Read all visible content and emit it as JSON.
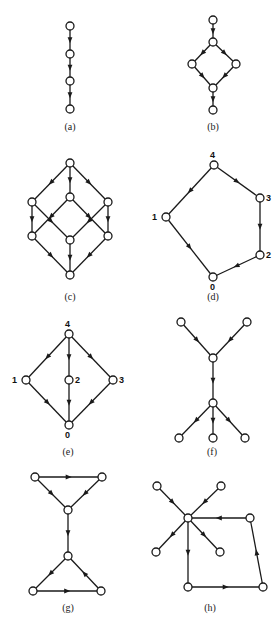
{
  "figure": {
    "width": 280,
    "height": 623,
    "colors": {
      "stroke": "#1a1a1a",
      "node_fill": "#ffffff",
      "background": "#ffffff"
    },
    "node_radius": 4,
    "panels": [
      {
        "id": "a",
        "caption": "(a)",
        "caption_pos": [
          70,
          130
        ],
        "nodes": [
          {
            "id": "a1",
            "x": 70,
            "y": 26
          },
          {
            "id": "a2",
            "x": 70,
            "y": 54
          },
          {
            "id": "a3",
            "x": 70,
            "y": 81
          },
          {
            "id": "a4",
            "x": 70,
            "y": 109
          }
        ],
        "edges": [
          [
            "a1",
            "a2"
          ],
          [
            "a2",
            "a3"
          ],
          [
            "a3",
            "a4"
          ]
        ]
      },
      {
        "id": "b",
        "caption": "(b)",
        "caption_pos": [
          213,
          130
        ],
        "nodes": [
          {
            "id": "b1",
            "x": 213,
            "y": 20
          },
          {
            "id": "b2",
            "x": 213,
            "y": 42
          },
          {
            "id": "b3",
            "x": 192,
            "y": 64
          },
          {
            "id": "b4",
            "x": 236,
            "y": 64
          },
          {
            "id": "b5",
            "x": 213,
            "y": 88
          },
          {
            "id": "b6",
            "x": 213,
            "y": 110
          }
        ],
        "edges": [
          [
            "b1",
            "b2"
          ],
          [
            "b2",
            "b3"
          ],
          [
            "b2",
            "b4"
          ],
          [
            "b3",
            "b5"
          ],
          [
            "b4",
            "b5"
          ],
          [
            "b5",
            "b6"
          ]
        ]
      },
      {
        "id": "c",
        "caption": "(c)",
        "caption_pos": [
          70,
          300
        ],
        "nodes": [
          {
            "id": "c1",
            "x": 70,
            "y": 163
          },
          {
            "id": "c2",
            "x": 32,
            "y": 202
          },
          {
            "id": "c3",
            "x": 70,
            "y": 197
          },
          {
            "id": "c4",
            "x": 108,
            "y": 202
          },
          {
            "id": "c5",
            "x": 32,
            "y": 236
          },
          {
            "id": "c6",
            "x": 70,
            "y": 240
          },
          {
            "id": "c7",
            "x": 108,
            "y": 236
          },
          {
            "id": "c8",
            "x": 70,
            "y": 275
          }
        ],
        "edges": [
          [
            "c1",
            "c2"
          ],
          [
            "c1",
            "c3"
          ],
          [
            "c1",
            "c4"
          ],
          [
            "c2",
            "c5"
          ],
          [
            "c2",
            "c6"
          ],
          [
            "c3",
            "c5"
          ],
          [
            "c3",
            "c7"
          ],
          [
            "c4",
            "c6"
          ],
          [
            "c4",
            "c7"
          ],
          [
            "c5",
            "c8"
          ],
          [
            "c6",
            "c8"
          ],
          [
            "c7",
            "c8"
          ]
        ]
      },
      {
        "id": "d",
        "caption": "(d)",
        "caption_pos": [
          213,
          300
        ],
        "nodes": [
          {
            "id": "d4",
            "x": 214,
            "y": 165,
            "label": "4",
            "label_pos": [
              210,
              158
            ]
          },
          {
            "id": "d3",
            "x": 260,
            "y": 198,
            "label": "3",
            "label_pos": [
              266,
              201
            ]
          },
          {
            "id": "d1",
            "x": 166,
            "y": 217,
            "label": "1",
            "label_pos": [
              152,
              220
            ]
          },
          {
            "id": "d2",
            "x": 260,
            "y": 255,
            "label": "2",
            "label_pos": [
              266,
              258
            ]
          },
          {
            "id": "d0",
            "x": 213,
            "y": 277,
            "label": "0",
            "label_pos": [
              210,
              290
            ]
          }
        ],
        "edges": [
          [
            "d4",
            "d1"
          ],
          [
            "d4",
            "d3"
          ],
          [
            "d3",
            "d2"
          ],
          [
            "d2",
            "d0"
          ],
          [
            "d1",
            "d0"
          ]
        ]
      },
      {
        "id": "e",
        "caption": "(e)",
        "caption_pos": [
          68,
          455
        ],
        "nodes": [
          {
            "id": "e4",
            "x": 69,
            "y": 334,
            "label": "4",
            "label_pos": [
              65,
              327
            ]
          },
          {
            "id": "e1",
            "x": 26,
            "y": 380,
            "label": "1",
            "label_pos": [
              12,
              383
            ]
          },
          {
            "id": "e2",
            "x": 69,
            "y": 380,
            "label": "2",
            "label_pos": [
              75,
              383
            ]
          },
          {
            "id": "e3",
            "x": 113,
            "y": 380,
            "label": "3",
            "label_pos": [
              119,
              383
            ]
          },
          {
            "id": "e0",
            "x": 69,
            "y": 425,
            "label": "0",
            "label_pos": [
              65,
              438
            ]
          }
        ],
        "edges": [
          [
            "e4",
            "e1"
          ],
          [
            "e4",
            "e2"
          ],
          [
            "e4",
            "e3"
          ],
          [
            "e1",
            "e0"
          ],
          [
            "e2",
            "e0"
          ],
          [
            "e3",
            "e0"
          ]
        ]
      },
      {
        "id": "f",
        "caption": "(f)",
        "caption_pos": [
          212,
          455
        ],
        "nodes": [
          {
            "id": "f1",
            "x": 181,
            "y": 322
          },
          {
            "id": "f2",
            "x": 247,
            "y": 322
          },
          {
            "id": "f3",
            "x": 213,
            "y": 358
          },
          {
            "id": "f4",
            "x": 213,
            "y": 403
          },
          {
            "id": "f5",
            "x": 179,
            "y": 438
          },
          {
            "id": "f6",
            "x": 213,
            "y": 438
          },
          {
            "id": "f7",
            "x": 245,
            "y": 438
          }
        ],
        "edges": [
          [
            "f1",
            "f3"
          ],
          [
            "f2",
            "f3"
          ],
          [
            "f3",
            "f4"
          ],
          [
            "f4",
            "f5"
          ],
          [
            "f4",
            "f6"
          ],
          [
            "f4",
            "f7"
          ]
        ]
      },
      {
        "id": "g",
        "caption": "(g)",
        "caption_pos": [
          68,
          611
        ],
        "nodes": [
          {
            "id": "g1",
            "x": 35,
            "y": 477
          },
          {
            "id": "g2",
            "x": 102,
            "y": 477
          },
          {
            "id": "g3",
            "x": 68,
            "y": 510
          },
          {
            "id": "g4",
            "x": 68,
            "y": 556
          },
          {
            "id": "g5",
            "x": 33,
            "y": 591
          },
          {
            "id": "g6",
            "x": 101,
            "y": 591
          }
        ],
        "edges": [
          [
            "g1",
            "g2"
          ],
          [
            "g1",
            "g3"
          ],
          [
            "g2",
            "g3"
          ],
          [
            "g3",
            "g4"
          ],
          [
            "g4",
            "g5"
          ],
          [
            "g6",
            "g4"
          ],
          [
            "g5",
            "g6"
          ]
        ]
      },
      {
        "id": "h",
        "caption": "(h)",
        "caption_pos": [
          210,
          611
        ],
        "nodes": [
          {
            "id": "h1",
            "x": 157,
            "y": 486
          },
          {
            "id": "h2",
            "x": 221,
            "y": 486
          },
          {
            "id": "h3",
            "x": 188,
            "y": 518
          },
          {
            "id": "h4",
            "x": 250,
            "y": 518
          },
          {
            "id": "h5",
            "x": 156,
            "y": 552
          },
          {
            "id": "h6",
            "x": 220,
            "y": 552
          },
          {
            "id": "h7",
            "x": 188,
            "y": 587
          },
          {
            "id": "h8",
            "x": 263,
            "y": 587
          }
        ],
        "edges": [
          [
            "h1",
            "h3"
          ],
          [
            "h2",
            "h3"
          ],
          [
            "h3",
            "h5"
          ],
          [
            "h3",
            "h6"
          ],
          [
            "h3",
            "h7"
          ],
          [
            "h7",
            "h8"
          ],
          [
            "h8",
            "h4"
          ],
          [
            "h4",
            "h3"
          ]
        ]
      }
    ]
  }
}
